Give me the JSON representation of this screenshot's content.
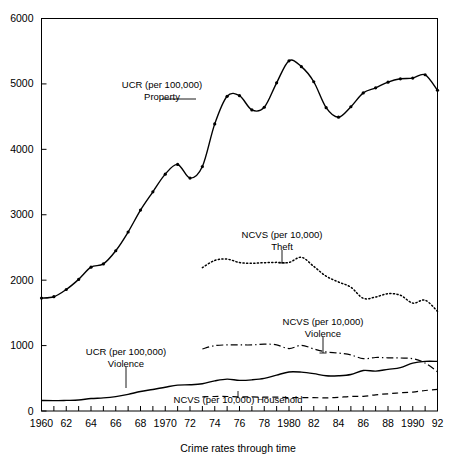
{
  "chart_data": {
    "type": "line",
    "title": "",
    "xlabel": "Crime rates through time",
    "ylabel": "",
    "xlim": [
      1960,
      1992
    ],
    "ylim": [
      0,
      6000
    ],
    "grid": false,
    "legend_position": "inline-annotations",
    "y_ticks": [
      0,
      1000,
      2000,
      3000,
      4000,
      5000,
      6000
    ],
    "y_tick_labels": [
      "0",
      "1000",
      "2000",
      "3000",
      "4000",
      "5000",
      "6000"
    ],
    "x_ticks": [
      1960,
      1961,
      1962,
      1963,
      1964,
      1965,
      1966,
      1967,
      1968,
      1969,
      1970,
      1971,
      1972,
      1973,
      1974,
      1975,
      1976,
      1977,
      1978,
      1979,
      1980,
      1981,
      1982,
      1983,
      1984,
      1985,
      1986,
      1987,
      1988,
      1989,
      1990,
      1991,
      1992
    ],
    "x_tick_labels": [
      {
        "x": 1960,
        "label": "1960"
      },
      {
        "x": 1962,
        "label": "62"
      },
      {
        "x": 1964,
        "label": "64"
      },
      {
        "x": 1966,
        "label": "66"
      },
      {
        "x": 1968,
        "label": "68"
      },
      {
        "x": 1970,
        "label": "1970"
      },
      {
        "x": 1972,
        "label": "72"
      },
      {
        "x": 1974,
        "label": "74"
      },
      {
        "x": 1976,
        "label": "76"
      },
      {
        "x": 1978,
        "label": "78"
      },
      {
        "x": 1980,
        "label": "1980"
      },
      {
        "x": 1982,
        "label": "82"
      },
      {
        "x": 1984,
        "label": "84"
      },
      {
        "x": 1986,
        "label": "86"
      },
      {
        "x": 1988,
        "label": "88"
      },
      {
        "x": 1990,
        "label": "1990"
      },
      {
        "x": 1992,
        "label": "92"
      }
    ],
    "series": [
      {
        "name": "UCR (per 100,000) Property",
        "style": "solid-with-markers",
        "markers": true,
        "x": [
          1960,
          1961,
          1962,
          1963,
          1964,
          1965,
          1966,
          1967,
          1968,
          1969,
          1970,
          1971,
          1972,
          1973,
          1974,
          1975,
          1976,
          1977,
          1978,
          1979,
          1980,
          1981,
          1982,
          1983,
          1984,
          1985,
          1986,
          1987,
          1988,
          1989,
          1990,
          1991,
          1992
        ],
        "values": [
          1726,
          1747,
          1857,
          2012,
          2198,
          2249,
          2450,
          2736,
          3071,
          3351,
          3621,
          3769,
          3561,
          3737,
          4389,
          4811,
          4820,
          4602,
          4643,
          5017,
          5353,
          5264,
          5033,
          4637,
          4492,
          4651,
          4863,
          4940,
          5027,
          5078,
          5089,
          5140,
          4903
        ]
      },
      {
        "name": "NCVS (per 10,000) Theft",
        "style": "dotted",
        "markers": false,
        "x": [
          1973,
          1974,
          1975,
          1976,
          1977,
          1978,
          1979,
          1980,
          1981,
          1982,
          1983,
          1984,
          1985,
          1986,
          1987,
          1988,
          1989,
          1990,
          1991,
          1992
        ],
        "values": [
          2191,
          2302,
          2322,
          2269,
          2258,
          2267,
          2272,
          2270,
          2350,
          2210,
          2061,
          1972,
          1892,
          1723,
          1743,
          1793,
          1770,
          1649,
          1694,
          1524
        ]
      },
      {
        "name": "UCR (per 100,000) Violence",
        "style": "solid",
        "markers": false,
        "x": [
          1960,
          1961,
          1962,
          1963,
          1964,
          1965,
          1966,
          1967,
          1968,
          1969,
          1970,
          1971,
          1972,
          1973,
          1974,
          1975,
          1976,
          1977,
          1978,
          1979,
          1980,
          1981,
          1982,
          1983,
          1984,
          1985,
          1986,
          1987,
          1988,
          1989,
          1990,
          1991,
          1992
        ],
        "values": [
          161,
          158,
          162,
          168,
          191,
          200,
          220,
          254,
          298,
          329,
          364,
          396,
          401,
          417,
          461,
          488,
          468,
          476,
          498,
          549,
          597,
          594,
          571,
          538,
          539,
          558,
          620,
          610,
          637,
          663,
          732,
          758,
          758
        ]
      },
      {
        "name": "NCVS (per 10,000) Violence",
        "style": "dash-dot",
        "markers": false,
        "x": [
          1973,
          1974,
          1975,
          1976,
          1977,
          1978,
          1979,
          1980,
          1981,
          1982,
          1983,
          1984,
          1985,
          1986,
          1987,
          1988,
          1989,
          1990,
          1991,
          1992
        ],
        "values": [
          948,
          1000,
          1010,
          1010,
          1010,
          1022,
          1011,
          955,
          1004,
          949,
          903,
          886,
          857,
          800,
          818,
          813,
          810,
          800,
          733,
          600
        ]
      },
      {
        "name": "NCVS (per 10,000) Household",
        "style": "dashed",
        "markers": false,
        "x": [
          1973,
          1974,
          1975,
          1976,
          1977,
          1978,
          1979,
          1980,
          1981,
          1982,
          1983,
          1984,
          1985,
          1986,
          1987,
          1988,
          1989,
          1990,
          1991,
          1992
        ],
        "values": [
          217,
          222,
          222,
          215,
          216,
          211,
          212,
          204,
          205,
          205,
          200,
          209,
          222,
          224,
          248,
          263,
          278,
          289,
          313,
          330
        ]
      }
    ],
    "annotations": [
      {
        "id": "ucr-property-label",
        "lines": [
          "UCR (per 100,000)",
          "Property"
        ],
        "align": "middle"
      },
      {
        "id": "ncvs-theft-label",
        "lines": [
          "NCVS (per 10,000)",
          "Theft"
        ],
        "align": "middle"
      },
      {
        "id": "ncvs-violence-label",
        "lines": [
          "NCVS (per 10,000)",
          "Violence"
        ],
        "align": "middle"
      },
      {
        "id": "ucr-violence-label",
        "lines": [
          "UCR (per 100,000)",
          "Violence"
        ],
        "align": "middle"
      },
      {
        "id": "ncvs-household-label",
        "lines": [
          "NCVS (per 10,000) Household"
        ],
        "align": "middle"
      }
    ]
  },
  "labels": {
    "ucr_property_l1": "UCR (per 100,000)",
    "ucr_property_l2": "Property",
    "ncvs_theft_l1": "NCVS (per 10,000)",
    "ncvs_theft_l2": "Theft",
    "ncvs_violence_l1": "NCVS (per 10,000)",
    "ncvs_violence_l2": "Violence",
    "ucr_violence_l1": "UCR (per 100,000)",
    "ucr_violence_l2": "Violence",
    "ncvs_household_l1": "NCVS (per 10,000) Household",
    "axis_title": "Crime rates through time",
    "y0": "0",
    "y1000": "1000",
    "y2000": "2000",
    "y3000": "3000",
    "y4000": "4000",
    "y5000": "5000",
    "y6000": "6000"
  }
}
